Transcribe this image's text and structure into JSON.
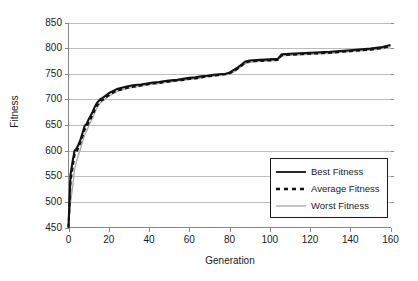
{
  "chart_data": {
    "type": "line",
    "title": "",
    "xlabel": "Generation",
    "ylabel": "Fitness",
    "xlim": [
      0,
      160
    ],
    "ylim": [
      450,
      850
    ],
    "xticks": [
      0,
      20,
      40,
      60,
      80,
      100,
      120,
      140,
      160
    ],
    "yticks": [
      450,
      500,
      550,
      600,
      650,
      700,
      750,
      800,
      850
    ],
    "grid": "horizontal",
    "legend_position": "lower-right",
    "colors": {
      "best": "#111111",
      "average": "#111111",
      "worst": "#a8a8a8",
      "grid": "#bdbdbd",
      "axis": "#888888",
      "text": "#1a1a1a"
    },
    "series": [
      {
        "name": "Best Fitness",
        "style": "solid",
        "color": "#111111",
        "x": [
          0,
          1,
          2,
          3,
          4,
          5,
          6,
          7,
          8,
          9,
          10,
          11,
          12,
          13,
          14,
          15,
          16,
          17,
          18,
          19,
          20,
          22,
          24,
          26,
          28,
          30,
          33,
          36,
          39,
          42,
          45,
          48,
          51,
          54,
          57,
          60,
          63,
          66,
          69,
          72,
          75,
          78,
          80,
          82,
          84,
          86,
          88,
          90,
          95,
          100,
          104,
          106,
          110,
          120,
          130,
          140,
          150,
          156,
          160
        ],
        "y": [
          450,
          553,
          578,
          600,
          604,
          612,
          622,
          635,
          648,
          652,
          661,
          668,
          676,
          685,
          692,
          697,
          701,
          703,
          706,
          709,
          712,
          716,
          720,
          722,
          724,
          726,
          728,
          729,
          731,
          733,
          734,
          736,
          737,
          738,
          740,
          742,
          743,
          745,
          746,
          748,
          749,
          750,
          752,
          757,
          762,
          768,
          774,
          776,
          777,
          778,
          779,
          788,
          789,
          791,
          793,
          796,
          799,
          802,
          806
        ]
      },
      {
        "name": "Average Fitness",
        "style": "dashed",
        "color": "#111111",
        "x": [
          0,
          1,
          2,
          3,
          4,
          5,
          6,
          7,
          8,
          9,
          10,
          11,
          12,
          13,
          14,
          15,
          16,
          17,
          18,
          19,
          20,
          22,
          24,
          26,
          28,
          30,
          33,
          36,
          39,
          42,
          45,
          48,
          51,
          54,
          57,
          60,
          63,
          66,
          69,
          72,
          75,
          78,
          80,
          82,
          84,
          86,
          88,
          90,
          95,
          100,
          104,
          106,
          110,
          120,
          130,
          140,
          150,
          156,
          160
        ],
        "y": [
          450,
          540,
          566,
          592,
          598,
          606,
          616,
          628,
          641,
          646,
          655,
          662,
          670,
          679,
          687,
          692,
          697,
          699,
          702,
          705,
          708,
          713,
          717,
          719,
          721,
          723,
          725,
          727,
          729,
          731,
          732,
          734,
          735,
          737,
          738,
          740,
          741,
          743,
          745,
          746,
          748,
          749,
          751,
          755,
          760,
          766,
          772,
          774,
          775,
          776,
          777,
          786,
          787,
          789,
          791,
          794,
          797,
          800,
          804
        ]
      },
      {
        "name": "Worst Fitness",
        "style": "solid",
        "color": "#a8a8a8",
        "x": [
          0,
          1,
          2,
          3,
          4,
          5,
          6,
          7,
          8,
          9,
          10,
          11,
          12,
          13,
          14,
          15,
          16,
          17,
          18,
          19,
          20,
          22,
          24,
          26,
          28,
          30,
          33,
          36,
          39,
          42,
          45,
          48,
          51,
          54,
          57,
          60,
          63,
          66,
          69,
          72,
          75,
          78,
          80,
          82,
          84,
          86,
          88,
          90,
          95,
          100,
          104,
          106,
          110,
          120,
          130,
          140,
          150,
          156,
          160
        ],
        "y": [
          450,
          498,
          528,
          562,
          580,
          592,
          604,
          617,
          630,
          638,
          648,
          656,
          664,
          673,
          682,
          688,
          694,
          697,
          700,
          703,
          706,
          711,
          715,
          718,
          720,
          722,
          724,
          726,
          728,
          730,
          731,
          733,
          734,
          736,
          737,
          739,
          740,
          742,
          744,
          745,
          747,
          748,
          750,
          753,
          758,
          764,
          770,
          772,
          774,
          775,
          776,
          785,
          786,
          788,
          790,
          793,
          796,
          799,
          803
        ]
      }
    ]
  },
  "axes": {
    "ylabel": "Fitness",
    "xlabel": "Generation",
    "ytick_labels": [
      "850",
      "800",
      "750",
      "700",
      "650",
      "600",
      "550",
      "500",
      "450"
    ],
    "xtick_labels": [
      "0",
      "20",
      "40",
      "60",
      "80",
      "100",
      "120",
      "140",
      "160"
    ]
  },
  "legend": {
    "items": [
      {
        "label": "Best Fitness",
        "style": "solid",
        "color": "#111111"
      },
      {
        "label": "Average Fitness",
        "style": "dashed",
        "color": "#111111"
      },
      {
        "label": "Worst Fitness",
        "style": "solid",
        "color": "#a8a8a8"
      }
    ]
  }
}
